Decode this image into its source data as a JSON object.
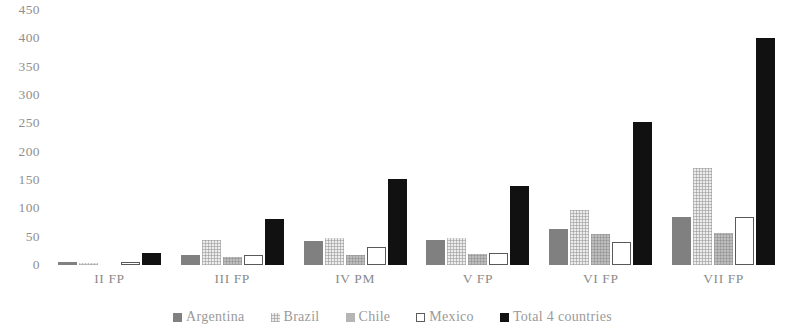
{
  "chart_data": {
    "type": "bar",
    "title": "",
    "subtitle": "",
    "xlabel": "",
    "ylabel": "",
    "categories": [
      "II FP",
      "III FP",
      "IV PM",
      "V FP",
      "VI FP",
      "VII FP"
    ],
    "series": [
      {
        "name": "Argentina",
        "color": "#808080",
        "values": [
          5,
          18,
          42,
          44,
          63,
          85
        ]
      },
      {
        "name": "Brazil",
        "color": "#ececec",
        "values": [
          3,
          45,
          47,
          48,
          97,
          172
        ]
      },
      {
        "name": "Chile",
        "color": "#b5b5b5",
        "values": [
          0,
          15,
          18,
          20,
          55,
          57
        ]
      },
      {
        "name": "Mexico",
        "color": "#ffffff",
        "values": [
          5,
          18,
          32,
          22,
          40,
          85
        ]
      },
      {
        "name": "Total 4 countries",
        "color": "#121212",
        "values": [
          22,
          82,
          152,
          140,
          253,
          400
        ]
      }
    ],
    "ylim": [
      0,
      450
    ],
    "yticks": [
      450,
      400,
      350,
      300,
      250,
      200,
      150,
      100,
      50,
      0
    ],
    "ytick_labels": [
      "450",
      "400",
      "350",
      "300",
      "250",
      "200",
      "150",
      "100",
      "50",
      "0"
    ],
    "grid": false,
    "legend_position": "bottom"
  },
  "legend": {
    "items": [
      {
        "label": "Argentina",
        "swatch": "argentina"
      },
      {
        "label": "Brazil",
        "swatch": "brazil"
      },
      {
        "label": "Chile",
        "swatch": "chile"
      },
      {
        "label": "Mexico",
        "swatch": "mexico"
      },
      {
        "label": "Total 4 countries",
        "swatch": "total"
      }
    ]
  }
}
